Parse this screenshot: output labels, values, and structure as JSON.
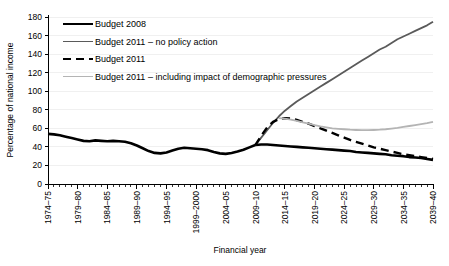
{
  "chart_data": {
    "type": "line",
    "title": "",
    "xlabel": "Financial year",
    "ylabel": "Percentage of national income",
    "ylim": [
      0,
      180
    ],
    "ytick_step": 20,
    "yticks": [
      "0",
      "20",
      "40",
      "60",
      "80",
      "100",
      "120",
      "140",
      "160",
      "180"
    ],
    "xlim": [
      1974,
      2039
    ],
    "xtick_step": 5,
    "xticks": [
      "1974–75",
      "1979–80",
      "1984–85",
      "1989–90",
      "1994–95",
      "1999–2000",
      "2004–05",
      "2009–10",
      "2014–15",
      "2019–20",
      "2024–25",
      "2029–30",
      "2034–35",
      "2039–40"
    ],
    "grid": "horizontal-light",
    "legend_position": "top-left-inside",
    "series": [
      {
        "name": "Budget 2008",
        "color": "#000000",
        "width": 2.6,
        "dash": "none",
        "x": [
          1974,
          1975,
          1976,
          1977,
          1978,
          1979,
          1980,
          1981,
          1982,
          1983,
          1984,
          1985,
          1986,
          1987,
          1988,
          1989,
          1990,
          1991,
          1992,
          1993,
          1994,
          1995,
          1996,
          1997,
          1998,
          1999,
          2000,
          2001,
          2002,
          2003,
          2004,
          2005,
          2006,
          2007,
          2008,
          2009,
          2010,
          2011,
          2012,
          2013,
          2014,
          2015,
          2016,
          2017,
          2018,
          2019,
          2020,
          2021,
          2022,
          2023,
          2024,
          2025,
          2026,
          2027,
          2028,
          2029,
          2030,
          2031,
          2032,
          2033,
          2034,
          2035,
          2036,
          2037,
          2038,
          2039
        ],
        "values": [
          54,
          53.5,
          52.5,
          51,
          49.5,
          48,
          46.5,
          46,
          47,
          46.5,
          46,
          46.5,
          46,
          45.5,
          44,
          41.5,
          38.5,
          35.5,
          33.5,
          33,
          34,
          36,
          38,
          39,
          38.5,
          38,
          37.5,
          36.5,
          34.5,
          33,
          32.5,
          33.5,
          35,
          37,
          39.5,
          42,
          42.5,
          42.5,
          42,
          41.5,
          41,
          40.5,
          40,
          39.5,
          39,
          38.5,
          38,
          37.5,
          37,
          36.5,
          36,
          35.5,
          34.5,
          34,
          33.5,
          33,
          32.5,
          32,
          31,
          30.5,
          30,
          29,
          28.5,
          28,
          27,
          26
        ]
      },
      {
        "name": "Budget 2011 – no policy action",
        "color": "#5a5a5a",
        "width": 1.8,
        "dash": "none",
        "x": [
          2009,
          2010,
          2011,
          2012,
          2013,
          2014,
          2015,
          2016,
          2017,
          2018,
          2019,
          2020,
          2021,
          2022,
          2023,
          2024,
          2025,
          2026,
          2027,
          2028,
          2029,
          2030,
          2031,
          2032,
          2033,
          2034,
          2035,
          2036,
          2037,
          2038,
          2039
        ],
        "values": [
          42,
          50,
          58,
          66,
          73,
          79,
          84,
          89,
          93,
          97,
          101,
          105,
          109,
          113,
          117,
          121,
          125,
          129,
          133,
          137,
          141,
          145,
          148,
          152,
          156,
          159,
          162,
          165,
          168,
          171,
          175
        ]
      },
      {
        "name": "Budget 2011",
        "color": "#000000",
        "width": 2.4,
        "dash": "8 5",
        "x": [
          2009,
          2010,
          2011,
          2012,
          2013,
          2014,
          2015,
          2016,
          2017,
          2018,
          2019,
          2020,
          2021,
          2022,
          2023,
          2024,
          2025,
          2026,
          2027,
          2028,
          2029,
          2030,
          2031,
          2032,
          2033,
          2034,
          2035,
          2036,
          2037,
          2038,
          2039
        ],
        "values": [
          42,
          52,
          61,
          67,
          70,
          71,
          70.5,
          69,
          67,
          65,
          62.5,
          60,
          57.5,
          55,
          52.5,
          50,
          47.5,
          45.5,
          43.5,
          41.5,
          39.5,
          38,
          36.5,
          35,
          33.5,
          32,
          31,
          30,
          29,
          28,
          27
        ]
      },
      {
        "name": "Budget 2011 – including impact of demographic pressures",
        "color": "#b4b4b4",
        "width": 1.8,
        "dash": "none",
        "x": [
          2013,
          2014,
          2015,
          2016,
          2017,
          2018,
          2019,
          2020,
          2021,
          2022,
          2023,
          2024,
          2025,
          2026,
          2027,
          2028,
          2029,
          2030,
          2031,
          2032,
          2033,
          2034,
          2035,
          2036,
          2037,
          2038,
          2039
        ],
        "values": [
          71,
          70.5,
          69.5,
          68,
          66.5,
          65,
          63.5,
          62,
          61,
          60,
          59.5,
          59,
          58.5,
          58.2,
          58,
          58,
          58.2,
          58.5,
          59,
          59.8,
          60.5,
          61.5,
          62.5,
          63.5,
          64.5,
          65.5,
          67
        ]
      }
    ]
  },
  "legend": {
    "items": [
      {
        "label": "Budget 2008"
      },
      {
        "label": "Budget 2011 – no policy action"
      },
      {
        "label": "Budget 2011"
      },
      {
        "label": "Budget 2011 – including impact of demographic pressures"
      }
    ]
  }
}
